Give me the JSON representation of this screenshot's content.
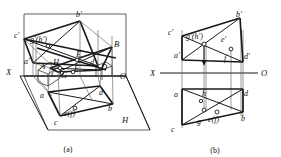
{
  "page": {
    "background": "#ffffff",
    "ink": "#1a1a1a",
    "width": 281,
    "height": 157
  },
  "captions": [
    {
      "id": "cap-a",
      "text": "(a)",
      "x": 68,
      "y": 149
    },
    {
      "id": "cap-b",
      "text": "(b)",
      "x": 215,
      "y": 150
    }
  ],
  "figure_a": {
    "name": "pictorial-projection-view",
    "axes": [
      {
        "id": "axis-x-a",
        "label": "X",
        "x": 6,
        "y": 72
      },
      {
        "id": "axis-o-a",
        "label": "O",
        "x": 122,
        "y": 76
      },
      {
        "id": "axis-h-a",
        "label": "H",
        "x": 124,
        "y": 120
      }
    ],
    "labels": [
      {
        "id": "a-b-prime",
        "text": "b′",
        "x": 78,
        "y": 14
      },
      {
        "id": "a-c-prime",
        "text": "c′",
        "x": 17,
        "y": 35
      },
      {
        "id": "a-gh-prime",
        "text": "g′(h′)",
        "x": 33,
        "y": 39
      },
      {
        "id": "a-B",
        "text": "B",
        "x": 117,
        "y": 44
      },
      {
        "id": "a-E-upper",
        "text": "E",
        "x": 79,
        "y": 54
      },
      {
        "id": "a-a-prime",
        "text": "a′",
        "x": 27,
        "y": 61
      },
      {
        "id": "a-A",
        "text": "A",
        "x": 43,
        "y": 66
      },
      {
        "id": "a-H",
        "text": "H",
        "x": 56,
        "y": 62
      },
      {
        "id": "a-d-prime",
        "text": "d′",
        "x": 93,
        "y": 62
      },
      {
        "id": "a-F",
        "text": "F",
        "x": 77,
        "y": 68
      },
      {
        "id": "a-D",
        "text": "D",
        "x": 104,
        "y": 67
      },
      {
        "id": "a-C",
        "text": "C",
        "x": 54,
        "y": 74
      },
      {
        "id": "a-G",
        "text": "G",
        "x": 64,
        "y": 75
      },
      {
        "id": "a-a",
        "text": "a",
        "x": 42,
        "y": 95
      },
      {
        "id": "a-d",
        "text": "d",
        "x": 101,
        "y": 92
      },
      {
        "id": "a-ef",
        "text": "e(f)",
        "x": 69,
        "y": 113
      },
      {
        "id": "a-b",
        "text": "b",
        "x": 110,
        "y": 108
      },
      {
        "id": "a-c",
        "text": "c",
        "x": 56,
        "y": 122
      }
    ]
  },
  "figure_b": {
    "name": "orthographic-projection-view",
    "axes": [
      {
        "id": "axis-x-b",
        "label": "X",
        "x": 152,
        "y": 76
      },
      {
        "id": "axis-o-b",
        "label": "O",
        "x": 262,
        "y": 76
      }
    ],
    "labels": [
      {
        "id": "b-b-prime",
        "text": "b′",
        "x": 237,
        "y": 14
      },
      {
        "id": "b-c-prime",
        "text": "c′",
        "x": 170,
        "y": 33
      },
      {
        "id": "b-gh-prime",
        "text": "g′(h′)",
        "x": 190,
        "y": 37
      },
      {
        "id": "b-e-prime",
        "text": "e′",
        "x": 222,
        "y": 39
      },
      {
        "id": "b-a-prime",
        "text": "a′",
        "x": 177,
        "y": 55
      },
      {
        "id": "b-f",
        "text": "f",
        "x": 224,
        "y": 58
      },
      {
        "id": "b-d-prime",
        "text": "d′",
        "x": 245,
        "y": 56
      },
      {
        "id": "b-a",
        "text": "a",
        "x": 176,
        "y": 94
      },
      {
        "id": "b-h",
        "text": "h",
        "x": 204,
        "y": 93
      },
      {
        "id": "b-d",
        "text": "d",
        "x": 245,
        "y": 93
      },
      {
        "id": "b-g",
        "text": "g",
        "x": 199,
        "y": 121
      },
      {
        "id": "b-ef",
        "text": "e(f)",
        "x": 214,
        "y": 119
      },
      {
        "id": "b-b",
        "text": "b",
        "x": 242,
        "y": 118
      },
      {
        "id": "b-c",
        "text": "c",
        "x": 173,
        "y": 129
      }
    ]
  }
}
